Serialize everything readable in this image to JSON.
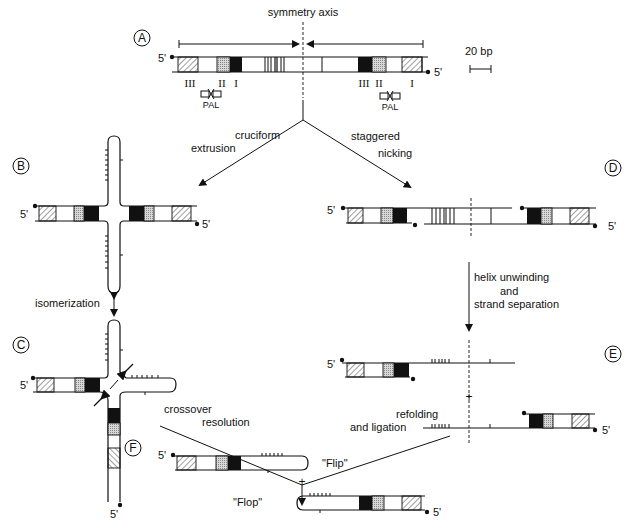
{
  "figure": {
    "panels": [
      {
        "id": "A",
        "label": "A"
      },
      {
        "id": "B",
        "label": "B"
      },
      {
        "id": "C",
        "label": "C"
      },
      {
        "id": "D",
        "label": "D"
      },
      {
        "id": "E",
        "label": "E"
      },
      {
        "id": "F",
        "label": "F"
      }
    ],
    "symmetry_axis": "symmetry axis",
    "scale_bar": "20 bp",
    "five_prime": "5'",
    "regions_left": [
      "III",
      "II",
      "I"
    ],
    "regions_right": [
      "III",
      "II",
      "I"
    ],
    "pal": "PAL",
    "steps": {
      "cruciform_1": "cruciform",
      "cruciform_2": "extrusion",
      "staggered_1": "staggered",
      "staggered_2": "nicking",
      "isomerization": "isomerization",
      "helix_1": "helix unwinding",
      "helix_2": "and",
      "helix_3": "strand separation",
      "crossover_1": "crossover",
      "crossover_2": "resolution",
      "refolding_1": "refolding",
      "refolding_2": "and ligation"
    },
    "plus": "+",
    "flip": "\"Flip\"",
    "flop": "\"Flop\""
  },
  "colors": {
    "ink": "#111111",
    "stipple": "#bbbbbb",
    "background": "#ffffff"
  }
}
